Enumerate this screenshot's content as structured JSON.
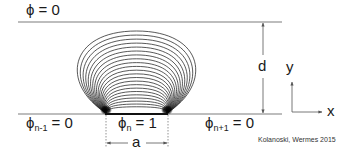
{
  "figure": {
    "colors": {
      "electrode_line": "#bdbdbd",
      "field_line": "#222222",
      "arrow": "#555555",
      "text": "#1a1a1a"
    },
    "labels": {
      "top_potential": "ϕ = 0",
      "left_symbol": "ϕ",
      "left_sub": "n-1",
      "left_value": " = 0",
      "center_symbol": "ϕ",
      "center_sub": "n",
      "center_value": " = 1",
      "right_symbol": "ϕ",
      "right_sub": "n+1",
      "right_value": " = 0",
      "gap_dimension": "d",
      "width_dimension": "a",
      "axis_y": "y",
      "axis_x": "x",
      "credit": "Kolanoski, Wermes 2015"
    },
    "geometry": {
      "top_line_y": 22,
      "bottom_line_y": 114,
      "line_x_start": 18,
      "line_x_end": 282,
      "electrode_x_start": 105,
      "electrode_x_end": 168,
      "field_line_count": 22
    }
  }
}
